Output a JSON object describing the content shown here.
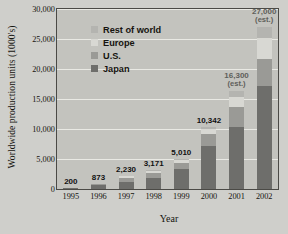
{
  "chart_data": {
    "type": "bar",
    "title": "",
    "xlabel": "Year",
    "ylabel": "Worldwide production units (1000's)",
    "categories": [
      "1995",
      "1996",
      "1997",
      "1998",
      "1999",
      "2000",
      "2001",
      "2002"
    ],
    "series": [
      {
        "name": "Japan",
        "values": [
          180,
          640,
          1180,
          1900,
          3320,
          7100,
          10400,
          17150
        ]
      },
      {
        "name": "U.S.",
        "values": [
          15,
          150,
          620,
          780,
          1100,
          2100,
          3300,
          4600
        ]
      },
      {
        "name": "Europe",
        "values": [
          5,
          60,
          300,
          330,
          400,
          800,
          1600,
          3500
        ]
      },
      {
        "name": "Rest of world",
        "values": [
          0,
          23,
          130,
          161,
          190,
          342,
          1000,
          1750
        ]
      }
    ],
    "totals": [
      200,
      873,
      2230,
      3171,
      5010,
      10342,
      16300,
      27000
    ],
    "data_labels": [
      {
        "year": "1995",
        "text": "200",
        "note": "",
        "estimated": false
      },
      {
        "year": "1996",
        "text": "873",
        "note": "",
        "estimated": false
      },
      {
        "year": "1997",
        "text": "2,230",
        "note": "",
        "estimated": false
      },
      {
        "year": "1998",
        "text": "3,171",
        "note": "",
        "estimated": false
      },
      {
        "year": "1999",
        "text": "5,010",
        "note": "",
        "estimated": false
      },
      {
        "year": "2000",
        "text": "10,342",
        "note": "",
        "estimated": false
      },
      {
        "year": "2001",
        "text": "16,300",
        "note": "(est.)",
        "estimated": true
      },
      {
        "year": "2002",
        "text": "27,000",
        "note": "(est.)",
        "estimated": true
      }
    ],
    "ylim": [
      0,
      30000
    ],
    "yticks": [
      "0",
      "5,000",
      "10,000",
      "15,000",
      "20,000",
      "25,000",
      "30,000"
    ],
    "ytick_values": [
      0,
      5000,
      10000,
      15000,
      20000,
      25000,
      30000
    ],
    "grid": true,
    "legend_position": "upper-left-inside",
    "legend": [
      {
        "label": "Rest of world",
        "color": "#b4b4b0"
      },
      {
        "label": "Europe",
        "color": "#d8d8d3"
      },
      {
        "label": "U.S.",
        "color": "#9a9a96"
      },
      {
        "label": "Japan",
        "color": "#6e6e6b"
      }
    ],
    "colors": {
      "plot_background": "#c3c3be",
      "figure_background": "#cfcfcb",
      "gridline": "#e9e9e4",
      "frame": "#4b4a46",
      "text": "#16140f",
      "estimate_label": "#5f5f5b"
    }
  }
}
